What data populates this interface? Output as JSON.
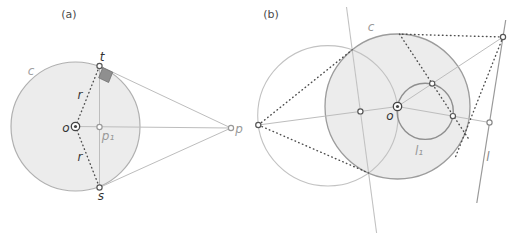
{
  "figure": {
    "width": 514,
    "height": 250,
    "background": "#ffffff",
    "colors": {
      "light_line": "#bdbdbd",
      "circle_stroke": "#9c9c9c",
      "aux_circle_stroke": "#c2c2c2",
      "circle_fill": "#ececec",
      "dark_dash": "#4d4d4d",
      "dark_point": "#555555",
      "gray_point": "#999999",
      "line_l": "#999999",
      "small_circle": "#8f8f8f",
      "square_fill": "#8f8f8f",
      "square_stroke": "#707070",
      "caption": "#4a4a4a",
      "gray_label": "#9a9a9a",
      "dark_label": "#333333"
    },
    "panels": [
      {
        "tag": "(a)",
        "tag_x": 69,
        "tag_y": 18
      },
      {
        "tag": "(b)",
        "tag_x": 271,
        "tag_y": 18
      }
    ],
    "circles": [
      {
        "name": "circle-c-a",
        "cx": 75.5,
        "cy": 126.5,
        "r": 64.5,
        "fill": "#ececec",
        "stroke": "#b0b0b0",
        "sw": 1.2
      },
      {
        "name": "circle-c-b",
        "cx": 397.5,
        "cy": 106.5,
        "r": 72.5,
        "fill": "#ececec",
        "stroke": "#9c9c9c",
        "sw": 1.3
      },
      {
        "name": "aux-circle-b",
        "cx": 327.9,
        "cy": 115.8,
        "r": 70.2,
        "fill": "none",
        "stroke": "#c2c2c2",
        "sw": 1.1
      },
      {
        "name": "inverse-circle-l1",
        "cx": 425.2,
        "cy": 111.3,
        "r": 28.1,
        "fill": "none",
        "stroke": "#8f8f8f",
        "sw": 1.4
      }
    ],
    "lines": [
      {
        "name": "chord-t-s-a",
        "x1": 99.5,
        "y1": 66,
        "x2": 99.5,
        "y2": 187.5,
        "stroke": "#bdbdbd",
        "sw": 1
      },
      {
        "name": "line-o-p-a",
        "x1": 75.5,
        "y1": 126.5,
        "x2": 231,
        "y2": 128,
        "stroke": "#bdbdbd",
        "sw": 1
      },
      {
        "name": "tangent-t-p-a",
        "x1": 99.5,
        "y1": 66,
        "x2": 231,
        "y2": 128,
        "stroke": "#bdbdbd",
        "sw": 1
      },
      {
        "name": "tangent-s-p-a",
        "x1": 99.5,
        "y1": 187.5,
        "x2": 231,
        "y2": 128,
        "stroke": "#bdbdbd",
        "sw": 1
      },
      {
        "name": "polar-line-b",
        "x1": 346.5,
        "y1": 7,
        "x2": 376.6,
        "y2": 233,
        "stroke": "#c2c2c2",
        "sw": 1.1
      },
      {
        "name": "line-p-o-b",
        "x1": 258.3,
        "y1": 125,
        "x2": 397.5,
        "y2": 106.5,
        "stroke": "#bdbdbd",
        "sw": 1
      },
      {
        "name": "ray-o-topright-b",
        "x1": 397.5,
        "y1": 106.5,
        "x2": 503,
        "y2": 37,
        "stroke": "#bdbdbd",
        "sw": 1
      },
      {
        "name": "ray-o-foot-b",
        "x1": 397.5,
        "y1": 106.5,
        "x2": 489.5,
        "y2": 122.5,
        "stroke": "#bdbdbd",
        "sw": 1
      },
      {
        "name": "line-l",
        "x1": 505.7,
        "y1": 20,
        "x2": 476.8,
        "y2": 203,
        "stroke": "#999999",
        "sw": 1.2
      }
    ],
    "dashed_lines": [
      {
        "name": "radius-o-t-a",
        "x1": 75.5,
        "y1": 126.5,
        "x2": 99.5,
        "y2": 66
      },
      {
        "name": "radius-o-s-a",
        "x1": 75.5,
        "y1": 126.5,
        "x2": 99.5,
        "y2": 187.5
      },
      {
        "name": "tangent-left-top-b",
        "x1": 258.3,
        "y1": 125,
        "x2": 352.2,
        "y2": 49.8
      },
      {
        "name": "tangent-left-bottom-b",
        "x1": 258.3,
        "y1": 125,
        "x2": 368.6,
        "y2": 173
      },
      {
        "name": "tangent-right-top-b",
        "x1": 503,
        "y1": 37,
        "x2": 399.5,
        "y2": 34.1
      },
      {
        "name": "tangent-right-bottom-b",
        "x1": 503,
        "y1": 37,
        "x2": 455.7,
        "y2": 156.5
      },
      {
        "name": "polar-chord-right-b",
        "x1": 399.5,
        "y1": 34.1,
        "x2": 469.3,
        "y2": 139.9
      }
    ],
    "polygons": [
      {
        "name": "right-angle-square",
        "points": "102.8,67.6 112.7,72.2 108.6,82.5 98.7,77.8",
        "fill": "#8f8f8f",
        "stroke": "#707070",
        "sw": 0.8
      }
    ],
    "points": [
      {
        "name": "point-t",
        "cx": 99.5,
        "cy": 66,
        "stroke": "#555555"
      },
      {
        "name": "point-s",
        "cx": 99.5,
        "cy": 187.5,
        "stroke": "#555555"
      },
      {
        "name": "point-p1",
        "cx": 99.5,
        "cy": 127,
        "stroke": "#999999"
      },
      {
        "name": "point-p",
        "cx": 231,
        "cy": 128,
        "stroke": "#999999"
      },
      {
        "name": "point-pole-left",
        "cx": 258.3,
        "cy": 125,
        "stroke": "#555555"
      },
      {
        "name": "point-inverse-pole",
        "cx": 360.4,
        "cy": 111.4,
        "stroke": "#555555"
      },
      {
        "name": "point-inverse-top",
        "cx": 432.2,
        "cy": 83.6,
        "stroke": "#555555"
      },
      {
        "name": "point-inverse-foot",
        "cx": 452.9,
        "cy": 116.1,
        "stroke": "#555555"
      },
      {
        "name": "point-foot-on-l",
        "cx": 489.5,
        "cy": 122.5,
        "stroke": "#888888"
      },
      {
        "name": "point-top-on-l",
        "cx": 503,
        "cy": 37,
        "stroke": "#555555"
      }
    ],
    "centers": [
      {
        "name": "center-o-a",
        "cx": 75.5,
        "cy": 126.5
      },
      {
        "name": "center-o-b",
        "cx": 397.5,
        "cy": 106.5
      }
    ],
    "labels": [
      {
        "name": "label-caption-a",
        "text": "(a)",
        "x": 69,
        "y": 18,
        "color": "#4a4a4a",
        "size": 11,
        "italic": false
      },
      {
        "name": "label-caption-b",
        "text": "(b)",
        "x": 271,
        "y": 18,
        "color": "#4a4a4a",
        "size": 11,
        "italic": false
      },
      {
        "name": "label-c-a",
        "text": "c",
        "x": 31,
        "y": 75,
        "color": "#a0a0a0",
        "size": 12,
        "italic": true
      },
      {
        "name": "label-r-top",
        "text": "r",
        "x": 80,
        "y": 99,
        "color": "#3a3a3a",
        "size": 12,
        "italic": true
      },
      {
        "name": "label-r-bot",
        "text": "r",
        "x": 80,
        "y": 161,
        "color": "#3a3a3a",
        "size": 12,
        "italic": true
      },
      {
        "name": "label-o-a",
        "text": "o",
        "x": 66,
        "y": 132,
        "color": "#333333",
        "size": 12,
        "italic": true
      },
      {
        "name": "label-t",
        "text": "t",
        "x": 102,
        "y": 61,
        "color": "#333333",
        "size": 12,
        "italic": true
      },
      {
        "name": "label-s",
        "text": "s",
        "x": 101,
        "y": 200,
        "color": "#333333",
        "size": 12,
        "italic": true
      },
      {
        "name": "label-p1",
        "text": "p₁",
        "x": 108,
        "y": 140,
        "color": "#999999",
        "size": 12,
        "italic": true
      },
      {
        "name": "label-p",
        "text": "p",
        "x": 239,
        "y": 133,
        "color": "#999999",
        "size": 12,
        "italic": true
      },
      {
        "name": "label-c-b",
        "text": "c",
        "x": 371,
        "y": 31,
        "color": "#9a9a9a",
        "size": 12,
        "italic": true
      },
      {
        "name": "label-o-b",
        "text": "o",
        "x": 390,
        "y": 120,
        "color": "#333333",
        "size": 12,
        "italic": true
      },
      {
        "name": "label-l1",
        "text": "l₁",
        "x": 419,
        "y": 155,
        "color": "#999999",
        "size": 12,
        "italic": true
      },
      {
        "name": "label-l",
        "text": "l",
        "x": 488,
        "y": 161,
        "color": "#888888",
        "size": 12,
        "italic": true
      }
    ]
  }
}
